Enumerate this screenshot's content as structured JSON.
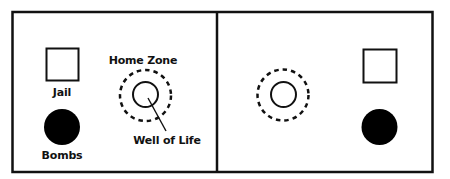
{
  "diagram": {
    "title": "",
    "colors": {
      "stroke": "#111111",
      "fill": "#000000",
      "background": "#ffffff"
    },
    "field": {
      "outer_box": {
        "x": 12,
        "y": 12,
        "width": 421,
        "height": 160
      },
      "divider_x": 217
    },
    "left_half": {
      "jail": {
        "label": "Jail",
        "x": 46,
        "y": 48,
        "size": 33
      },
      "bombs": {
        "label": "Bombs",
        "cx": 62,
        "cy": 127,
        "r": 18
      },
      "home_zone": {
        "label": "Home Zone",
        "cx": 145.5,
        "cy": 95.5,
        "r": 26
      },
      "well_of_life": {
        "label": "Well of Life",
        "cx": 145.5,
        "cy": 94.5,
        "r": 13
      }
    },
    "right_half": {
      "jail": {
        "x": 363,
        "y": 49,
        "size": 34
      },
      "bombs": {
        "cx": 379.5,
        "cy": 127,
        "r": 18
      },
      "home_zone": {
        "cx": 283,
        "cy": 95,
        "r": 26
      },
      "well_of_life": {
        "cx": 283.5,
        "cy": 94.5,
        "r": 13
      }
    },
    "pointer": {
      "from": [
        148,
        98
      ],
      "to": [
        166,
        131
      ]
    }
  }
}
